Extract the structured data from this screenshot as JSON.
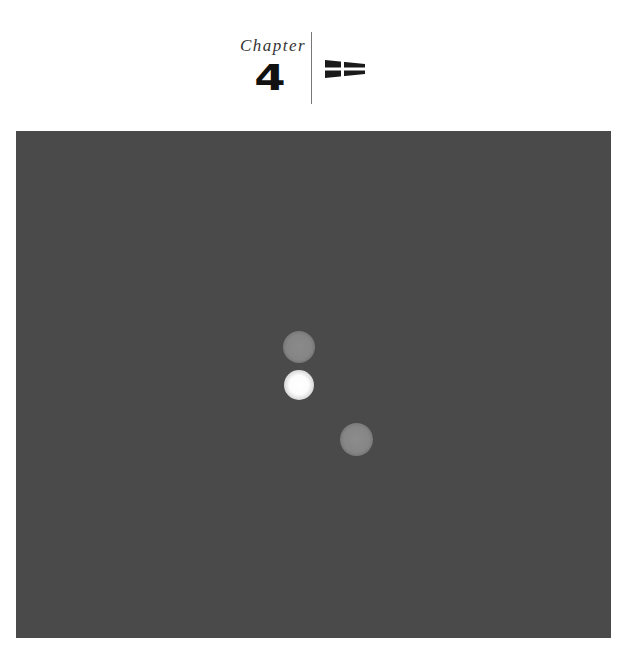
{
  "header": {
    "chapter_label": "Chapter",
    "chapter_number": "4",
    "icon": "signal-flag-icon"
  },
  "figure": {
    "background_color": "#4a4a4a",
    "spots": [
      {
        "name": "upper-gray-spot",
        "color": "#888888"
      },
      {
        "name": "bright-white-spot",
        "color": "#ffffff"
      },
      {
        "name": "lower-gray-spot",
        "color": "#898989"
      }
    ]
  }
}
